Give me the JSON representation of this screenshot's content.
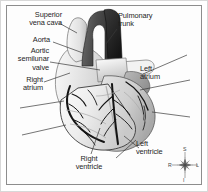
{
  "figure": {
    "type": "anatomical-diagram",
    "background_color": "#ffffff",
    "frame_color": "#8d8d8d",
    "label_color": "#1d1d1d",
    "leader_line_color": "#3a3a3a"
  },
  "labels": {
    "superior_vena_cava": "Superior\nvena cava",
    "superior_vena_cava_line1": "Superior",
    "superior_vena_cava_line2": "vena cava",
    "aorta": "Aorta",
    "aortic_semilunar_valve_line1": "Aortic",
    "aortic_semilunar_valve_line2": "semilunar",
    "aortic_semilunar_valve_line3": "valve",
    "right_atrium_line1": "Right",
    "right_atrium_line2": "atrium",
    "pulmonary_trunk_line1": "Pulmonary",
    "pulmonary_trunk_line2": "trunk",
    "left_atrium_line1": "Left",
    "left_atrium_line2": "atrium",
    "right_ventricle_line1": "Right",
    "right_ventricle_line2": "ventricle",
    "left_ventricle_line1": "Left",
    "left_ventricle_line2": "ventricle"
  },
  "orientation": {
    "superior": "S",
    "inferior": "I",
    "right": "R",
    "left": "L"
  },
  "structures": [
    {
      "name": "superior-vena-cava",
      "fill": "#e6e6e6"
    },
    {
      "name": "aorta",
      "fill": "#4a4a4a"
    },
    {
      "name": "aortic-semilunar-valve",
      "fill": "#9a9a9a"
    },
    {
      "name": "pulmonary-trunk",
      "fill": "#2e2e2e"
    },
    {
      "name": "right-atrium",
      "fill": "#dedede"
    },
    {
      "name": "left-atrium",
      "fill": "#bdbdbd"
    },
    {
      "name": "right-ventricle",
      "fill": "#ededed"
    },
    {
      "name": "left-ventricle",
      "fill": "#d6d6d6"
    },
    {
      "name": "coronary-arteries",
      "fill": "#1a1a1a"
    }
  ]
}
